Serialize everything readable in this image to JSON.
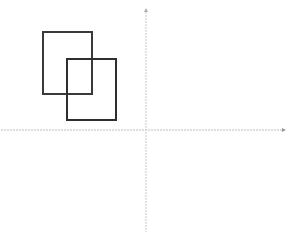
{
  "diagram": {
    "type": "coordinate-plane",
    "axes": {
      "x_axis": {
        "y": 130,
        "x1": 1,
        "x2": 286,
        "color": "#b8b8b8",
        "arrow": "right"
      },
      "y_axis": {
        "x": 146,
        "y1": 9,
        "y2": 232,
        "color": "#c4c4c4",
        "arrow": "top"
      }
    },
    "shapes": [
      {
        "name": "rectangle-1",
        "x": 43,
        "y": 32,
        "width": 49,
        "height": 62,
        "stroke": "#3a3a3a"
      },
      {
        "name": "rectangle-2",
        "x": 67,
        "y": 59,
        "width": 49,
        "height": 61,
        "stroke": "#2e2e2e"
      }
    ]
  }
}
